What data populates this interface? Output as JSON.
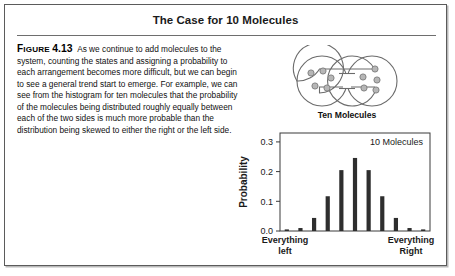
{
  "figure": {
    "title": "The Case for 10 Molecules",
    "label_prefix": "Figure",
    "label_number": "4.13",
    "caption": "As we continue to add molecules to the system, counting the states and assigning a probability to each arrangement becomes more difficult, but we can begin to see a general trend start to emerge. For example, we can see from the histogram for ten molecules that the probability of the molecules being distributed roughly equally between each of the two sides is much more probable than the distribution being skewed to either the right or the left side."
  },
  "diagram": {
    "caption": "Ten Molecules",
    "left_bulb_molecules": 5,
    "right_bulb_molecules": 5,
    "total_molecules": 10,
    "outline_color": "#6b6b6b",
    "molecule_fill": "#b6b6b6",
    "molecule_stroke": "#7d7d7d"
  },
  "chart_data": {
    "type": "bar",
    "title": "",
    "annotation": "10 Molecules",
    "xlabel": "",
    "ylabel": "Probability",
    "left_axis_note": "Everything left",
    "right_axis_note": "Everything Right",
    "categories": [
      "0",
      "1",
      "2",
      "3",
      "4",
      "5",
      "6",
      "7",
      "8",
      "9",
      "10"
    ],
    "values": [
      0.001,
      0.01,
      0.044,
      0.117,
      0.205,
      0.246,
      0.205,
      0.117,
      0.044,
      0.01,
      0.001
    ],
    "ylim": [
      0.0,
      0.33
    ],
    "yticks": [
      0.0,
      0.1,
      0.2,
      0.3
    ],
    "ytick_labels": [
      "0.0",
      "0.1",
      "0.2",
      "0.3"
    ],
    "grid": false,
    "legend": "none",
    "bar_color": "#2e2e2e",
    "axis_color": "#3a3a3a"
  }
}
